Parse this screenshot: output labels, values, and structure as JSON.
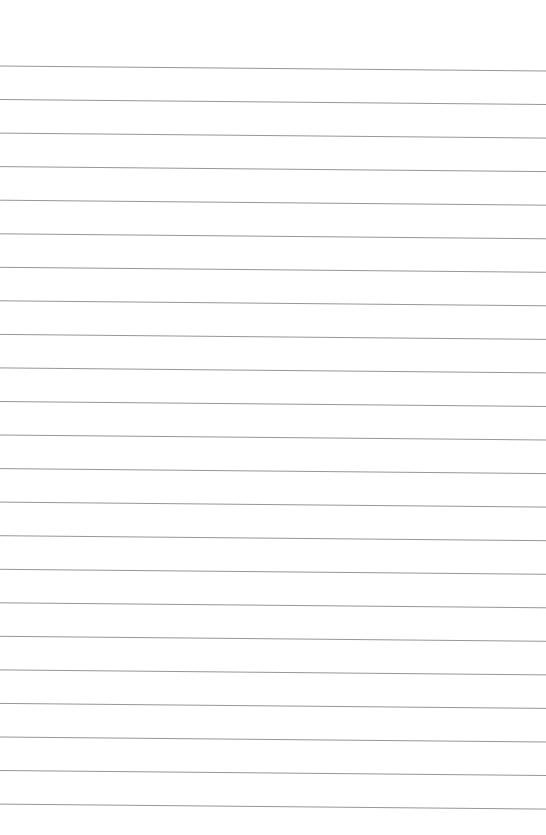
{
  "page": {
    "type": "ruled-paper",
    "background": "#ffffff",
    "line_color": "#8a8a8a",
    "line_count": 23,
    "first_line_y_left": 66,
    "line_spacing": 33.55,
    "line_x_start": 0,
    "line_x_end": 546,
    "slope_px": 5
  }
}
